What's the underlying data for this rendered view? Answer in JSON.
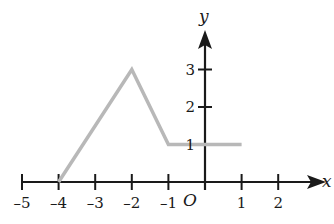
{
  "chart_data": {
    "type": "line",
    "title": "",
    "xlabel": "x",
    "ylabel": "y",
    "origin_label": "O",
    "x_ticks": [
      -5,
      -4,
      -3,
      -2,
      -1,
      1,
      2
    ],
    "x_tick_labels": [
      "-5",
      "-4",
      "-3",
      "-2",
      "-1",
      "1",
      "2"
    ],
    "y_ticks": [
      1,
      2,
      3
    ],
    "y_tick_labels": [
      "1",
      "2",
      "3"
    ],
    "xlim": [
      -5,
      2.5
    ],
    "ylim": [
      0,
      4
    ],
    "grid": false,
    "series": [
      {
        "name": "f(x)",
        "color": "#b8b8b8",
        "points": [
          [
            -4,
            0
          ],
          [
            -2,
            3
          ],
          [
            -1,
            1
          ],
          [
            1,
            1
          ]
        ]
      }
    ]
  },
  "colors": {
    "axis": "#1a1a1a",
    "graph": "#b8b8b8"
  }
}
